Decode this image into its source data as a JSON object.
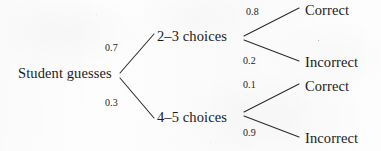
{
  "diagram": {
    "type": "probability-tree",
    "background_color": "#fdfdfd",
    "ink_color": "#1b1b1b",
    "root": {
      "label": "Student guesses",
      "x": 18,
      "y": 80
    },
    "level1": [
      {
        "id": "two-three-choices",
        "label": "2–3 choices",
        "probability": "0.7",
        "x": 157,
        "y": 43,
        "prob_x": 105,
        "prob_y": 53
      },
      {
        "id": "four-five-choices",
        "label": "4–5 choices",
        "probability": "0.3",
        "x": 157,
        "y": 124,
        "prob_x": 105,
        "prob_y": 108
      }
    ],
    "level2": [
      {
        "id": "two-three-correct",
        "parent": "two-three-choices",
        "label": "Correct",
        "probability": "0.8",
        "x": 305,
        "y": 17,
        "prob_x": 246,
        "prob_y": 17
      },
      {
        "id": "two-three-incorrect",
        "parent": "two-three-choices",
        "label": "Incorrect",
        "probability": "0.2",
        "x": 305,
        "y": 69,
        "prob_x": 243,
        "prob_y": 66
      },
      {
        "id": "four-five-correct",
        "parent": "four-five-choices",
        "label": "Correct",
        "probability": "0.1",
        "x": 305,
        "y": 93,
        "prob_x": 243,
        "prob_y": 90
      },
      {
        "id": "four-five-incorrect",
        "parent": "four-five-choices",
        "label": "Incorrect",
        "probability": "0.9",
        "x": 305,
        "y": 145,
        "prob_x": 243,
        "prob_y": 138
      }
    ],
    "edges": [
      {
        "id": "root-to-two-three",
        "x1": 120,
        "y1": 73,
        "x2": 154,
        "y2": 34
      },
      {
        "id": "root-to-four-five",
        "x1": 120,
        "y1": 78,
        "x2": 154,
        "y2": 118
      },
      {
        "id": "two-three-to-correct",
        "x1": 244,
        "y1": 36,
        "x2": 299,
        "y2": 8
      },
      {
        "id": "two-three-to-incorrect",
        "x1": 244,
        "y1": 40,
        "x2": 299,
        "y2": 61
      },
      {
        "id": "four-five-to-correct",
        "x1": 244,
        "y1": 112,
        "x2": 299,
        "y2": 84
      },
      {
        "id": "four-five-to-incorrect",
        "x1": 244,
        "y1": 116,
        "x2": 299,
        "y2": 137
      }
    ]
  }
}
